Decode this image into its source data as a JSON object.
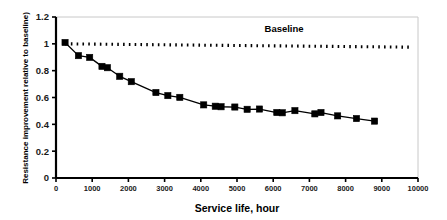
{
  "chart_data": {
    "type": "line",
    "title": "",
    "xlabel": "Service life, hour",
    "ylabel": "Resistance improvement relative to baseline)",
    "xlim": [
      0,
      10000
    ],
    "ylim": [
      0,
      1.2
    ],
    "xticks": [
      0,
      1000,
      2000,
      3000,
      4000,
      5000,
      6000,
      7000,
      8000,
      9000,
      10000
    ],
    "xtick_labels": [
      "0",
      "1000",
      "2000",
      "3000",
      "4000",
      "5000",
      "6000",
      "7000",
      "8000",
      "9000",
      "10000"
    ],
    "yticks": [
      0,
      0.2,
      0.4,
      0.6,
      0.8,
      1,
      1.2
    ],
    "ytick_labels": [
      "0",
      "0.2",
      "0.4",
      "0.6",
      "0.8",
      "1",
      "1.2"
    ],
    "grid": false,
    "legend_position": "inline-annotation",
    "series": [
      {
        "name": "Baseline",
        "style": "dotted",
        "marker": "none",
        "color": "#000000",
        "annotation": "Baseline",
        "annotation_x": 6300,
        "annotation_y": 1.085,
        "x": [
          250,
          9850
        ],
        "values": [
          1.0,
          0.975
        ]
      },
      {
        "name": "Resistance improvement",
        "style": "solid",
        "marker": "square",
        "color": "#000000",
        "x": [
          250,
          620,
          930,
          1270,
          1420,
          1760,
          2080,
          2760,
          3090,
          3420,
          4080,
          4400,
          4560,
          4940,
          5280,
          5620,
          6100,
          6250,
          6600,
          7150,
          7320,
          7780,
          8300,
          8800
        ],
        "values": [
          1.01,
          0.912,
          0.899,
          0.832,
          0.822,
          0.758,
          0.718,
          0.637,
          0.614,
          0.601,
          0.545,
          0.535,
          0.531,
          0.529,
          0.512,
          0.514,
          0.488,
          0.486,
          0.502,
          0.478,
          0.488,
          0.463,
          0.443,
          0.424
        ]
      }
    ]
  }
}
